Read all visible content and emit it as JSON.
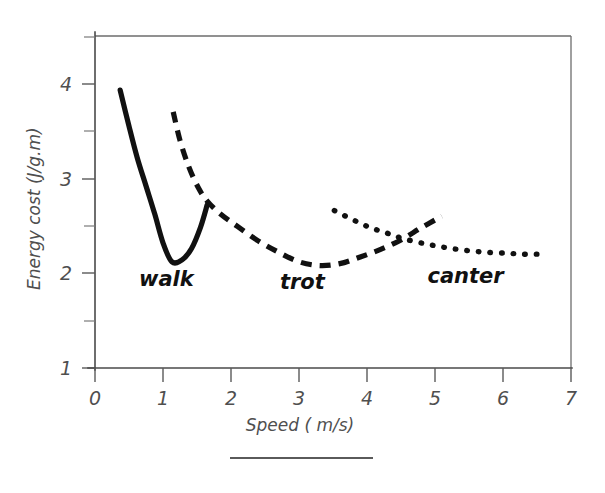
{
  "chart_data": {
    "type": "line",
    "title": "",
    "subtitle": "",
    "xlabel": "Speed ( m/s)",
    "ylabel": "Energy cost (J/g.m)",
    "xlim": [
      0,
      7
    ],
    "ylim": [
      1,
      4.5
    ],
    "xticks": [
      "0",
      "1",
      "2",
      "3",
      "4",
      "5",
      "6",
      "7"
    ],
    "xtick_values": [
      0,
      1,
      2,
      3,
      4,
      5,
      6,
      7
    ],
    "yticks": [
      "1",
      "2",
      "3",
      "4"
    ],
    "ytick_values": [
      1,
      2,
      3,
      4
    ],
    "yticks_minor": [
      1.5,
      2.5,
      3.5,
      4.5
    ],
    "grid": false,
    "legend": "inline-annotations",
    "series": [
      {
        "name": "walk",
        "style": "solid",
        "label": "walk",
        "label_x": 1.05,
        "label_y": 1.87,
        "points": [
          [
            0.37,
            3.93
          ],
          [
            0.5,
            3.55
          ],
          [
            0.62,
            3.22
          ],
          [
            0.75,
            2.92
          ],
          [
            0.88,
            2.62
          ],
          [
            1.0,
            2.32
          ],
          [
            1.13,
            2.12
          ],
          [
            1.28,
            2.14
          ],
          [
            1.42,
            2.26
          ],
          [
            1.55,
            2.48
          ],
          [
            1.65,
            2.72
          ]
        ]
      },
      {
        "name": "trot",
        "style": "dashed",
        "label": "trot",
        "label_x": 3.05,
        "label_y": 1.83,
        "points": [
          [
            1.15,
            3.7
          ],
          [
            1.25,
            3.4
          ],
          [
            1.38,
            3.12
          ],
          [
            1.52,
            2.9
          ],
          [
            1.65,
            2.76
          ],
          [
            1.85,
            2.62
          ],
          [
            2.1,
            2.49
          ],
          [
            2.4,
            2.34
          ],
          [
            2.7,
            2.22
          ],
          [
            3.0,
            2.12
          ],
          [
            3.3,
            2.08
          ],
          [
            3.6,
            2.1
          ],
          [
            3.9,
            2.17
          ],
          [
            4.2,
            2.25
          ],
          [
            4.5,
            2.35
          ],
          [
            4.8,
            2.48
          ],
          [
            5.1,
            2.6
          ]
        ]
      },
      {
        "name": "canter",
        "style": "dotted",
        "label": "canter",
        "label_x": 5.45,
        "label_y": 1.9,
        "points": [
          [
            3.52,
            2.66
          ],
          [
            3.8,
            2.56
          ],
          [
            4.05,
            2.48
          ],
          [
            4.3,
            2.42
          ],
          [
            4.55,
            2.36
          ],
          [
            4.85,
            2.31
          ],
          [
            5.15,
            2.27
          ],
          [
            5.45,
            2.24
          ],
          [
            5.75,
            2.22
          ],
          [
            6.05,
            2.21
          ],
          [
            6.3,
            2.2
          ],
          [
            6.5,
            2.2
          ]
        ]
      }
    ],
    "annotations": [
      {
        "text": "walk",
        "x": 1.05,
        "y": 1.87
      },
      {
        "text": "trot",
        "x": 3.05,
        "y": 1.83
      },
      {
        "text": "canter",
        "x": 5.45,
        "y": 1.9
      }
    ]
  },
  "figure": {
    "ylabel": "Energy cost (J/g.m)",
    "xlabel": "Speed ( m/s)",
    "footer_rule": true
  }
}
